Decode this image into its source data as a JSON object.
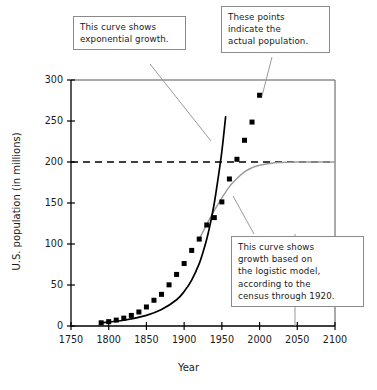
{
  "chart_data": {
    "type": "scatter",
    "title": "",
    "xlabel": "Year",
    "ylabel": "U.S. population (in millions)",
    "xlim": [
      1750,
      2100
    ],
    "ylim": [
      0,
      300
    ],
    "xticks": [
      1750,
      1800,
      1850,
      1900,
      1950,
      2000,
      2050,
      2100
    ],
    "xtick_labels": [
      "1750",
      "1800",
      "1850",
      "1900",
      "1950",
      "2000",
      "2050",
      "2100"
    ],
    "yticks": [
      0,
      50,
      100,
      150,
      200,
      250,
      300
    ],
    "ytick_labels": [
      "0",
      "50",
      "100",
      "150",
      "200",
      "250",
      "300"
    ],
    "grid": false,
    "legend": "none",
    "series": [
      {
        "name": "actual population",
        "kind": "scatter",
        "marker": "square",
        "color": "#000000",
        "points": [
          {
            "x": 1790,
            "y": 3.9
          },
          {
            "x": 1800,
            "y": 5.3
          },
          {
            "x": 1810,
            "y": 7.2
          },
          {
            "x": 1820,
            "y": 9.6
          },
          {
            "x": 1830,
            "y": 12.9
          },
          {
            "x": 1840,
            "y": 17.1
          },
          {
            "x": 1850,
            "y": 23.2
          },
          {
            "x": 1860,
            "y": 31.4
          },
          {
            "x": 1870,
            "y": 38.6
          },
          {
            "x": 1880,
            "y": 50.2
          },
          {
            "x": 1890,
            "y": 62.9
          },
          {
            "x": 1900,
            "y": 76.2
          },
          {
            "x": 1910,
            "y": 92.2
          },
          {
            "x": 1920,
            "y": 106.0
          },
          {
            "x": 1930,
            "y": 123.2
          },
          {
            "x": 1940,
            "y": 132.2
          },
          {
            "x": 1950,
            "y": 151.3
          },
          {
            "x": 1960,
            "y": 179.3
          },
          {
            "x": 1970,
            "y": 203.3
          },
          {
            "x": 1980,
            "y": 226.5
          },
          {
            "x": 1990,
            "y": 248.7
          },
          {
            "x": 2000,
            "y": 281.4
          }
        ]
      },
      {
        "name": "exponential growth model",
        "kind": "line",
        "color": "#000000",
        "style": "solid",
        "points": [
          {
            "x": 1790,
            "y": 3.9
          },
          {
            "x": 1820,
            "y": 7.0
          },
          {
            "x": 1850,
            "y": 13.0
          },
          {
            "x": 1870,
            "y": 20.0
          },
          {
            "x": 1890,
            "y": 32.0
          },
          {
            "x": 1900,
            "y": 42.0
          },
          {
            "x": 1910,
            "y": 56.0
          },
          {
            "x": 1920,
            "y": 76.0
          },
          {
            "x": 1925,
            "y": 90.0
          },
          {
            "x": 1930,
            "y": 106.0
          },
          {
            "x": 1935,
            "y": 126.0
          },
          {
            "x": 1940,
            "y": 150.0
          },
          {
            "x": 1945,
            "y": 180.0
          },
          {
            "x": 1950,
            "y": 213.0
          },
          {
            "x": 1955,
            "y": 255.0
          }
        ]
      },
      {
        "name": "logistic growth model",
        "kind": "line",
        "color": "#9a9a9a",
        "style": "solid",
        "points": [
          {
            "x": 1920,
            "y": 106.0
          },
          {
            "x": 1930,
            "y": 124.0
          },
          {
            "x": 1940,
            "y": 141.0
          },
          {
            "x": 1950,
            "y": 156.0
          },
          {
            "x": 1960,
            "y": 170.0
          },
          {
            "x": 1970,
            "y": 180.0
          },
          {
            "x": 1980,
            "y": 188.0
          },
          {
            "x": 1990,
            "y": 193.0
          },
          {
            "x": 2000,
            "y": 196.0
          },
          {
            "x": 2020,
            "y": 199.0
          },
          {
            "x": 2050,
            "y": 200.0
          },
          {
            "x": 2100,
            "y": 200.0
          }
        ]
      },
      {
        "name": "carrying capacity asymptote",
        "kind": "line",
        "color": "#000000",
        "style": "dashed",
        "points": [
          {
            "x": 1750,
            "y": 200
          },
          {
            "x": 2100,
            "y": 200
          }
        ]
      }
    ]
  },
  "callouts": {
    "exponential": {
      "name": "exponential-growth-callout",
      "lines": [
        "This curve shows",
        "exponential growth."
      ]
    },
    "actual": {
      "name": "actual-population-callout",
      "lines": [
        "These points",
        "indicate the",
        "actual population."
      ]
    },
    "logistic": {
      "name": "logistic-model-callout",
      "lines": [
        "This curve shows",
        "growth based on",
        "the logistic model,",
        "according to the",
        "census through 1920."
      ]
    }
  },
  "colors": {
    "background": "#ffffff",
    "axis": "#000000",
    "frame": "#555555",
    "marker": "#000000",
    "exponential_curve": "#000000",
    "logistic_curve": "#9a9a9a",
    "asymptote": "#000000",
    "callout_border": "#8a8a8a",
    "text": "#1a1a1a"
  }
}
